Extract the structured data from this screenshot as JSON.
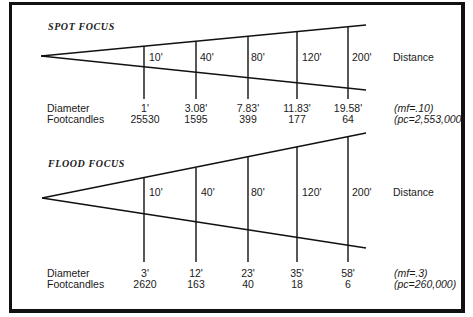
{
  "spot": {
    "title": "SPOT FOCUS",
    "distance_label": "Distance",
    "distances": [
      "10'",
      "40'",
      "80'",
      "120'",
      "200'"
    ],
    "row_labels": {
      "diameter": "Diameter",
      "footcandles": "Footcandles"
    },
    "diameters": [
      "1'",
      "3.08'",
      "7.83'",
      "11.83'",
      "19.58'"
    ],
    "footcandles": [
      "25530",
      "1595",
      "399",
      "177",
      "64"
    ],
    "multiplying_factor": "(mf=.10)",
    "peak_candela": "(pc=2,553,000)"
  },
  "flood": {
    "title": "FLOOD FOCUS",
    "distance_label": "Distance",
    "distances": [
      "10'",
      "40'",
      "80'",
      "120'",
      "200'"
    ],
    "row_labels": {
      "diameter": "Diameter",
      "footcandles": "Footcandles"
    },
    "diameters": [
      "3'",
      "12'",
      "23'",
      "35'",
      "58'"
    ],
    "footcandles": [
      "2620",
      "163",
      "40",
      "18",
      "6"
    ],
    "multiplying_factor": "(mf=.3)",
    "peak_candela": "(pc=260,000)"
  }
}
